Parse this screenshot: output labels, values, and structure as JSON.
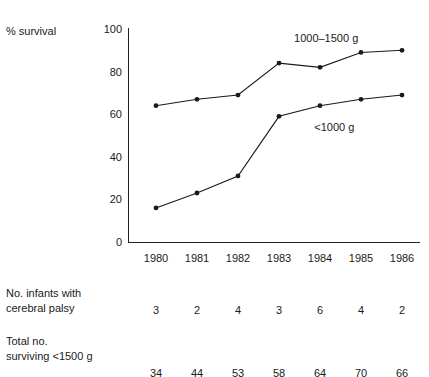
{
  "chart_data": {
    "type": "line",
    "title": "",
    "ylabel": "% survival",
    "xlabel": "",
    "ylim": [
      0,
      100
    ],
    "yticks": [
      0,
      20,
      40,
      60,
      80,
      100
    ],
    "grid": false,
    "legend_position": "inline-annotations",
    "categories": [
      "1980",
      "1981",
      "1982",
      "1983",
      "1984",
      "1985",
      "1986"
    ],
    "series": [
      {
        "name": "1000–1500 g",
        "values": [
          64,
          67,
          69,
          84,
          82,
          89,
          90
        ],
        "label_x_year": "1984",
        "color": "#1a1a1a"
      },
      {
        "name": "<1000 g",
        "values": [
          16,
          23,
          31,
          59,
          64,
          67,
          69
        ],
        "label_x_year": "1984.3",
        "color": "#1a1a1a"
      }
    ],
    "annotations": [
      {
        "text": "1000–1500 g",
        "value_y": 96
      },
      {
        "text": "<1000 g",
        "value_y": 54
      }
    ],
    "table": {
      "rows": [
        {
          "label_line1": "No. infants with",
          "label_line2": "cerebral palsy",
          "values": [
            "3",
            "2",
            "4",
            "3",
            "6",
            "4",
            "2"
          ]
        },
        {
          "label_line1": "Total no.",
          "label_line2": "surviving <1500 g",
          "values": [
            "34",
            "44",
            "53",
            "58",
            "64",
            "70",
            "66"
          ]
        }
      ]
    }
  }
}
